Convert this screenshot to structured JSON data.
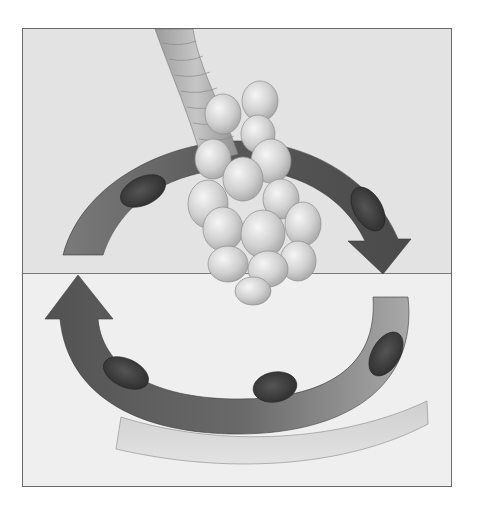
{
  "diagram": {
    "sections": {
      "external": "External respiration",
      "external_line1": "External",
      "external_line2": "respiration",
      "internal_line1": "Internal",
      "internal_line2": "respiration"
    },
    "top_labels": {
      "alveoli": "Alveoli",
      "pulmonary_line1": "Pulmonary blood",
      "pulmonary_line2": "capillary",
      "rbc_line1": "Red blood",
      "rbc_line2": "cell",
      "plasma": "Plasma",
      "dissolved_line1": "Dissolved",
      "dissolved_co2": "CO",
      "co2": "CO",
      "hco3": "HCO",
      "o2": "O",
      "pct_7": "7%",
      "pct_23": "23%",
      "pct_70": "70%",
      "pct_3": "3%",
      "pct_97": "97%"
    },
    "bottom_labels": {
      "tissue_cap_line1": "Tissue",
      "tissue_cap_line2": "blood",
      "tissue_cap_line3": "capillary",
      "dissolved_line1": "Dissolved",
      "dissolved_o2": "O",
      "hco3": "HCO",
      "interstitial": "Interstitial fluid",
      "tissue_cell": "Tissue cell",
      "co2": "CO",
      "o2": "O",
      "pct_7": "7%",
      "pct_23": "23%",
      "pct_70": "70%",
      "pct_3": "3%",
      "pct_97": "97%"
    },
    "subscripts": {
      "two": "2",
      "three": "3"
    },
    "colors": {
      "top_bg": "#e3e3e3",
      "bottom_bg": "#efefef",
      "vessel_dark": "#5a5a5a",
      "vessel_light": "#9a9a9a",
      "rbc": "#3e3e3e",
      "alveolus": "#d2d2d2",
      "tissue_cell": "#c4c4c4"
    }
  }
}
